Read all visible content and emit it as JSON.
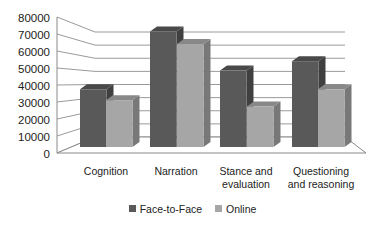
{
  "chart_data": {
    "type": "bar",
    "style": "3d-clustered-column",
    "title": "",
    "xlabel": "",
    "ylabel": "",
    "ylim": [
      0,
      80000
    ],
    "yticks": [
      0,
      10000,
      20000,
      30000,
      40000,
      50000,
      60000,
      70000,
      80000
    ],
    "ytick_labels": [
      "0",
      "10000",
      "20000",
      "30000",
      "40000",
      "50000",
      "60000",
      "70000",
      "80000"
    ],
    "grid": true,
    "legend_position": "bottom",
    "categories": [
      "Cognition",
      "Narration",
      "Stance and evaluation",
      "Questioning and reasoning"
    ],
    "category_label_lines": [
      [
        "Cognition"
      ],
      [
        "Narration"
      ],
      [
        "Stance and",
        "evaluation"
      ],
      [
        "Questioning",
        "and reasoning"
      ]
    ],
    "series": [
      {
        "name": "Face-to-Face",
        "color": "#595959",
        "values": [
          37000,
          74000,
          49000,
          55000
        ]
      },
      {
        "name": "Online",
        "color": "#a6a6a6",
        "values": [
          30000,
          66000,
          26000,
          37000
        ]
      }
    ]
  },
  "legend": {
    "items": [
      {
        "label": "Face-to-Face",
        "color": "#595959"
      },
      {
        "label": "Online",
        "color": "#a6a6a6"
      }
    ]
  }
}
